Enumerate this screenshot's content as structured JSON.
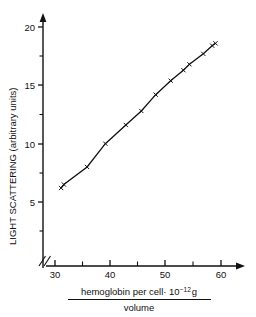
{
  "chart_data": {
    "type": "scatter",
    "title": "",
    "xlabel": "hemoglobin per cell · 10⁻¹² g / volume",
    "xlabel_numerator": "hemoglobin per cell· 10",
    "xlabel_numerator_exponent": "−12",
    "xlabel_numerator_unit": "g",
    "xlabel_denominator": "volume",
    "ylabel": "LIGHT SCATTERING (arbitrary units)",
    "xlim": [
      28,
      63
    ],
    "ylim": [
      0,
      21.5
    ],
    "x_major_ticks": [
      30,
      40,
      50,
      60
    ],
    "x_minor_ticks": [
      35,
      45,
      55
    ],
    "y_major_ticks": [
      5,
      10,
      15,
      20
    ],
    "y_minor_ticks": [
      2.5,
      7.5,
      12.5,
      17.5
    ],
    "x_tick_labels": [
      "30",
      "40",
      "50",
      "60"
    ],
    "y_tick_labels": [
      "5",
      "10",
      "15",
      "20"
    ],
    "grid": false,
    "legend": false,
    "axis_break_y": true,
    "marker": "x",
    "line_style": "solid",
    "series": [
      {
        "name": "light scattering vs hemoglobin concentration",
        "x": [
          31.1,
          31.6,
          35.8,
          39.1,
          42.8,
          45.6,
          48.2,
          50.9,
          53.2,
          54.3,
          56.8,
          58.4,
          59.0
        ],
        "y": [
          6.2,
          6.5,
          8.0,
          10.0,
          11.6,
          12.8,
          14.2,
          15.4,
          16.3,
          16.8,
          17.7,
          18.4,
          18.6
        ]
      }
    ]
  },
  "axis_break": {
    "symbol": "break-marker"
  }
}
